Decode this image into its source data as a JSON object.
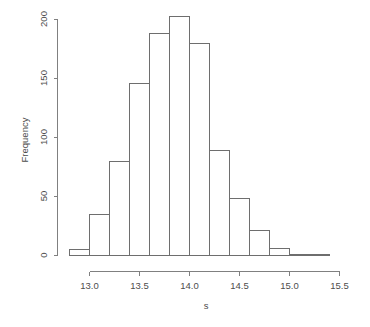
{
  "chart_data": {
    "type": "bar",
    "title": "",
    "subtitle": "",
    "xlabel": "s",
    "ylabel": "Frequency",
    "xlim": [
      12.75,
      15.55
    ],
    "ylim": [
      0,
      210
    ],
    "grid": false,
    "legend": null,
    "bin_width": 0.2,
    "bin_edges": [
      12.8,
      13.0,
      13.2,
      13.4,
      13.6,
      13.8,
      14.0,
      14.2,
      14.4,
      14.6,
      14.8,
      15.0,
      15.2,
      15.4
    ],
    "categories": [
      "12.8-13.0",
      "13.0-13.2",
      "13.2-13.4",
      "13.4-13.6",
      "13.6-13.8",
      "13.8-14.0",
      "14.0-14.2",
      "14.2-14.4",
      "14.4-14.6",
      "14.6-14.8",
      "14.8-15.0",
      "15.0-15.2",
      "15.2-15.4"
    ],
    "values": [
      5,
      35,
      80,
      146,
      188,
      203,
      180,
      89,
      48,
      21,
      6,
      0,
      1
    ],
    "x_ticks": [
      13.0,
      13.5,
      14.0,
      14.5,
      15.0,
      15.5
    ],
    "x_tick_labels": [
      "13.0",
      "13.5",
      "14.0",
      "14.5",
      "15.0",
      "15.5"
    ],
    "y_ticks": [
      0,
      50,
      100,
      150,
      200
    ],
    "y_tick_labels": [
      "0",
      "50",
      "100",
      "150",
      "200"
    ]
  },
  "style": {
    "axis_color": "#808080",
    "bar_stroke": "#6e6e6e",
    "bar_fill": "none",
    "text_color": "#4d4d4d",
    "background": "#ffffff"
  },
  "labels": {
    "x_axis_title": "s",
    "y_axis_title": "Frequency",
    "y_tick_0": "0",
    "y_tick_1": "50",
    "y_tick_2": "100",
    "y_tick_3": "150",
    "y_tick_4": "200",
    "x_tick_0": "13.0",
    "x_tick_1": "13.5",
    "x_tick_2": "14.0",
    "x_tick_3": "14.5",
    "x_tick_4": "15.0",
    "x_tick_5": "15.5"
  }
}
